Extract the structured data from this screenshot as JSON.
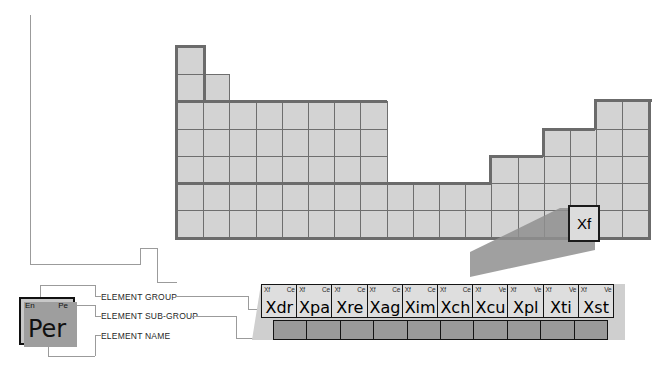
{
  "diagram": {
    "legend_key": {
      "group_label": "En",
      "subgroup_label": "Pe",
      "name_label": "Per"
    },
    "callouts": [
      {
        "id": "element-group",
        "text": "ELEMENT GROUP"
      },
      {
        "id": "element-sub-group",
        "text": "ELEMENT SUB-GROUP"
      },
      {
        "id": "element-name",
        "text": "ELEMENT NAME"
      }
    ],
    "highlighted_element": {
      "name": "Xf"
    },
    "series_row": {
      "elements": [
        {
          "group": "Xf",
          "subgroup": "Ce",
          "name": "Xdr"
        },
        {
          "group": "Xf",
          "subgroup": "Ce",
          "name": "Xpa"
        },
        {
          "group": "Xf",
          "subgroup": "Ce",
          "name": "Xre"
        },
        {
          "group": "Xf",
          "subgroup": "Ce",
          "name": "Xag"
        },
        {
          "group": "Xf",
          "subgroup": "Ce",
          "name": "Xim"
        },
        {
          "group": "Xf",
          "subgroup": "Ce",
          "name": "Xch"
        },
        {
          "group": "Xf",
          "subgroup": "Ve",
          "name": "Xcu"
        },
        {
          "group": "Xf",
          "subgroup": "Ve",
          "name": "Xpl"
        },
        {
          "group": "Xf",
          "subgroup": "Ve",
          "name": "Xti"
        },
        {
          "group": "Xf",
          "subgroup": "Ve",
          "name": "Xst"
        }
      ]
    },
    "colors": {
      "cell_fill": "#d3d3d3",
      "cell_stroke": "#6e6e6e",
      "frame_stroke": "#6b6b6b",
      "series_fill": "#dedede",
      "series_stroke": "#141414",
      "shadow": "#8f8f8f",
      "connector": "#9b9b9b",
      "legend_fill": "#c8c8c8"
    },
    "grid": {
      "columns": 18,
      "rows": 7,
      "row_lengths": [
        1,
        2,
        8,
        8,
        8,
        18,
        18
      ]
    }
  }
}
